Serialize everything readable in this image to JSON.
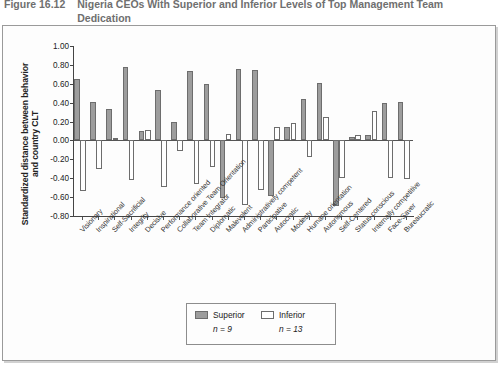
{
  "caption": {
    "label": "Figure 16.12",
    "text": "Nigeria CEOs With Superior and Inferior Levels of Top Management Team Dedication"
  },
  "legend": {
    "superior_label": "Superior",
    "inferior_label": "Inferior",
    "superior_n": "n = 9",
    "inferior_n": "n = 13",
    "superior_color": "#9d9d9d",
    "inferior_color": "#ffffff",
    "position": "bottom-center"
  },
  "chart_data": {
    "type": "bar",
    "title": "Nigeria CEOs With Superior and Inferior Levels of Top Management Team Dedication",
    "xlabel": "",
    "ylabel": "Standardized distance between behavior and country CLT",
    "ylim": [
      -0.8,
      1.0
    ],
    "ytick_step": 0.2,
    "grid": false,
    "yticks": [
      "1.00",
      "0.80",
      "0.60",
      "0.40",
      "0.20",
      "0.00",
      "-0.20",
      "-0.40",
      "-0.60",
      "-0.80"
    ],
    "ytick_values": [
      1.0,
      0.8,
      0.6,
      0.4,
      0.2,
      0.0,
      -0.2,
      -0.4,
      -0.6,
      -0.8
    ],
    "categories": [
      "Visionary",
      "Inspirational",
      "Self-Sacrificial",
      "Integrity",
      "Decisive",
      "Performance oriented",
      "Collaborative Team Orientation",
      "Team Integrator",
      "Diplomatic",
      "Malevolent",
      "Administratively competent",
      "Participative",
      "Autocratic",
      "Modesty",
      "Humane orientation",
      "Autonomous",
      "Self-Centered",
      "Status conscious",
      "Internally competitive",
      "Face-Saver",
      "Bureaucratic"
    ],
    "series": [
      {
        "name": "Superior",
        "n": 9,
        "values": [
          0.65,
          0.41,
          0.33,
          0.78,
          0.1,
          0.53,
          0.2,
          0.74,
          0.6,
          -0.61,
          0.76,
          0.75,
          -0.59,
          0.14,
          0.44,
          0.61,
          -0.69,
          0.04,
          0.06,
          0.4,
          0.41
        ]
      },
      {
        "name": "Inferior",
        "n": 13,
        "values": [
          -0.54,
          -0.3,
          0.03,
          -0.42,
          0.11,
          -0.49,
          -0.11,
          -0.46,
          -0.28,
          0.07,
          -0.68,
          -0.52,
          0.14,
          0.18,
          -0.18,
          0.25,
          -0.4,
          0.06,
          0.31,
          -0.4,
          -0.41
        ]
      }
    ]
  }
}
